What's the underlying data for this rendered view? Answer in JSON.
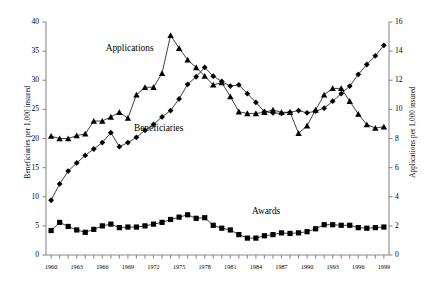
{
  "chart_data": {
    "type": "line",
    "title": "",
    "xlabel": "",
    "x": [
      1960,
      1961,
      1962,
      1963,
      1964,
      1965,
      1966,
      1967,
      1968,
      1969,
      1970,
      1971,
      1972,
      1973,
      1974,
      1975,
      1976,
      1977,
      1978,
      1979,
      1980,
      1981,
      1982,
      1983,
      1984,
      1985,
      1986,
      1987,
      1988,
      1989,
      1990,
      1991,
      1992,
      1993,
      1994,
      1995,
      1996,
      1997,
      1998,
      1999
    ],
    "x_tick_labels": [
      "1960",
      "1963",
      "1966",
      "1969",
      "1972",
      "1975",
      "1978",
      "1981",
      "1984",
      "1987",
      "1990",
      "1993",
      "1996",
      "1999"
    ],
    "x_tick_years": [
      1960,
      1963,
      1966,
      1969,
      1972,
      1975,
      1978,
      1981,
      1984,
      1987,
      1990,
      1993,
      1996,
      1999
    ],
    "xlim": [
      1959.4,
      1999.6
    ],
    "grid": false,
    "legend_position": "inline-annotations",
    "axes": {
      "left": {
        "label": "Beneficiaries per 1,000 insured",
        "min": 0,
        "max": 40,
        "step": 5,
        "ticks": [
          0,
          5,
          10,
          15,
          20,
          25,
          30,
          35,
          40
        ],
        "tick_labels": [
          "0",
          "5",
          "10",
          "15",
          "20",
          "25",
          "30",
          "35",
          "40"
        ]
      },
      "right": {
        "label": "Applications per 1,000 insured",
        "min": 0,
        "max": 16,
        "step": 2,
        "ticks": [
          0,
          2,
          4,
          6,
          8,
          10,
          12,
          14,
          16
        ],
        "tick_labels": [
          "0",
          "2",
          "4",
          "6",
          "8",
          "10",
          "12",
          "14",
          "16"
        ]
      }
    },
    "series": [
      {
        "name": "Applications",
        "axis": "right",
        "marker": "triangle",
        "color": "#000000",
        "label_x": 1969.2,
        "label_y_left": 35.2,
        "values_right_axis": [
          8.2,
          8.0,
          8.0,
          8.2,
          8.3,
          9.2,
          9.2,
          9.5,
          9.8,
          9.4,
          11.0,
          11.5,
          11.5,
          12.5,
          15.1,
          14.2,
          13.4,
          12.9,
          12.3,
          11.7,
          11.9,
          10.9,
          9.8,
          9.7,
          9.7,
          9.8,
          10.0,
          9.8,
          9.8,
          8.4,
          8.9,
          10.0,
          11.0,
          11.4,
          11.4,
          10.6,
          9.7,
          9.0,
          8.7,
          8.8
        ],
        "values_left_equiv": [
          20.4,
          20.0,
          20.0,
          20.5,
          20.8,
          23.0,
          23.0,
          23.7,
          24.5,
          23.5,
          27.5,
          28.8,
          28.8,
          31.2,
          37.7,
          35.5,
          33.5,
          32.2,
          30.7,
          29.2,
          29.6,
          27.2,
          24.6,
          24.3,
          24.3,
          24.5,
          24.9,
          24.5,
          24.5,
          20.9,
          22.2,
          24.9,
          27.5,
          28.6,
          28.6,
          26.4,
          24.2,
          22.4,
          21.8,
          22.0
        ]
      },
      {
        "name": "Beneficiaries",
        "axis": "left",
        "marker": "diamond",
        "color": "#000000",
        "label_x": 1972.6,
        "label_y_left": 21.5,
        "values": [
          9.4,
          12.2,
          14.4,
          15.8,
          17.1,
          18.2,
          19.3,
          21.0,
          18.6,
          19.3,
          20.2,
          21.4,
          22.4,
          23.7,
          24.8,
          26.8,
          29.3,
          30.6,
          32.2,
          30.7,
          29.8,
          29.0,
          29.2,
          27.7,
          26.2,
          24.6,
          24.4,
          24.3,
          24.5,
          24.8,
          24.4,
          24.7,
          25.2,
          26.4,
          27.7,
          29.0,
          31.0,
          32.7,
          34.2,
          36.0
        ]
      },
      {
        "name": "Awards",
        "axis": "right",
        "marker": "square",
        "color": "#000000",
        "label_x": 1985.2,
        "label_y_left": 7.2,
        "values_right_axis": [
          1.7,
          2.3,
          2.0,
          1.7,
          1.6,
          1.8,
          2.0,
          2.1,
          1.9,
          1.9,
          1.9,
          2.0,
          2.1,
          2.2,
          2.4,
          2.6,
          2.7,
          2.5,
          2.5,
          2.0,
          1.8,
          1.7,
          1.4,
          1.2,
          1.2,
          1.3,
          1.4,
          1.5,
          1.5,
          1.5,
          1.6,
          1.8,
          2.1,
          2.1,
          2.0,
          2.0,
          1.9,
          1.8,
          1.8,
          1.9
        ],
        "values_left_equiv": [
          4.2,
          5.6,
          4.9,
          4.3,
          3.9,
          4.4,
          5.0,
          5.3,
          4.7,
          4.8,
          4.8,
          5.0,
          5.3,
          5.6,
          6.1,
          6.5,
          6.9,
          6.3,
          6.4,
          5.1,
          4.6,
          4.3,
          3.5,
          2.9,
          2.9,
          3.3,
          3.5,
          3.8,
          3.7,
          3.8,
          4.0,
          4.5,
          5.2,
          5.2,
          5.1,
          5.1,
          4.7,
          4.6,
          4.7,
          4.8
        ]
      }
    ]
  }
}
